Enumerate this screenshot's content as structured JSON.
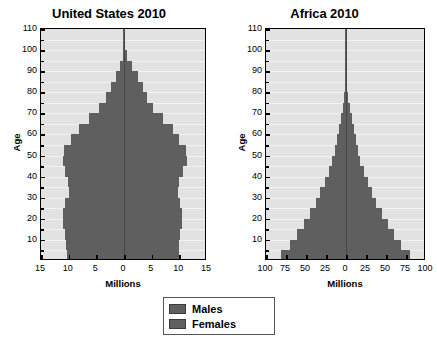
{
  "figure": {
    "background": "#ffffff",
    "bar_color": "#5f5f5f",
    "plot_background": "#e2e2e2",
    "axis_color": "#000000"
  },
  "legend": {
    "position": "bottom-center",
    "items": [
      {
        "label": "Males",
        "color": "#5f5f5f"
      },
      {
        "label": "Females",
        "color": "#5f5f5f"
      }
    ]
  },
  "chart_data": [
    {
      "type": "bar",
      "orientation": "population-pyramid",
      "title": "United States 2010",
      "xlabel": "Millions",
      "ylabel": "Age",
      "xlim": [
        -15,
        15
      ],
      "ylim": [
        0,
        110
      ],
      "grid": true,
      "xticks": [
        -15,
        -10,
        -5,
        0,
        5,
        10,
        15
      ],
      "xticklabels": [
        "15",
        "10",
        "5",
        "0",
        "5",
        "10",
        "15"
      ],
      "yticks": [
        10,
        20,
        30,
        40,
        50,
        60,
        70,
        80,
        90,
        100,
        110
      ],
      "yticklabels": [
        "10",
        "20",
        "30",
        "40",
        "50",
        "60",
        "70",
        "80",
        "90",
        "100",
        "110"
      ],
      "age_bands": [
        0,
        5,
        10,
        15,
        20,
        25,
        30,
        35,
        40,
        45,
        50,
        55,
        60,
        65,
        70,
        75,
        80,
        85,
        90,
        95,
        100,
        105
      ],
      "band_width": 5,
      "series": [
        {
          "name": "Males",
          "side": "left",
          "values": [
            10.3,
            10.4,
            10.6,
            11.0,
            11.0,
            10.6,
            9.9,
            10.1,
            10.6,
            11.1,
            10.8,
            9.5,
            8.2,
            6.3,
            4.5,
            3.3,
            2.4,
            1.5,
            0.7,
            0.25,
            0.05,
            0.01
          ]
        },
        {
          "name": "Females",
          "side": "right",
          "values": [
            9.9,
            10.0,
            10.2,
            10.5,
            10.5,
            10.2,
            9.7,
            10.0,
            10.6,
            11.3,
            11.2,
            10.0,
            8.8,
            7.0,
            5.2,
            4.1,
            3.4,
            2.5,
            1.4,
            0.6,
            0.15,
            0.02
          ]
        }
      ]
    },
    {
      "type": "bar",
      "orientation": "population-pyramid",
      "title": "Africa 2010",
      "xlabel": "Millions",
      "ylabel": "Age",
      "xlim": [
        -100,
        100
      ],
      "ylim": [
        0,
        110
      ],
      "grid": true,
      "xticks": [
        -100,
        -75,
        -50,
        -25,
        0,
        25,
        50,
        75,
        100
      ],
      "xticklabels": [
        "100",
        "75",
        "50",
        "25",
        "0",
        "25",
        "50",
        "75",
        "100"
      ],
      "yticks": [
        10,
        20,
        30,
        40,
        50,
        60,
        70,
        80,
        90,
        100,
        110
      ],
      "yticklabels": [
        "10",
        "20",
        "30",
        "40",
        "50",
        "60",
        "70",
        "80",
        "90",
        "100",
        "110"
      ],
      "age_bands": [
        0,
        5,
        10,
        15,
        20,
        25,
        30,
        35,
        40,
        45,
        50,
        55,
        60,
        65,
        70,
        75,
        80,
        85,
        90,
        95,
        100,
        105
      ],
      "band_width": 5,
      "series": [
        {
          "name": "Males",
          "side": "left",
          "values": [
            81,
            70,
            61,
            53,
            45,
            38,
            32,
            26,
            21,
            17,
            14,
            11,
            8.5,
            6.2,
            4.2,
            2.6,
            1.4,
            0.6,
            0.2,
            0.06,
            0.02,
            0.005
          ]
        },
        {
          "name": "Females",
          "side": "right",
          "values": [
            80,
            69,
            60,
            52,
            45,
            38,
            32,
            27,
            22,
            18,
            15,
            12,
            9.5,
            7.0,
            4.9,
            3.1,
            1.8,
            0.8,
            0.3,
            0.09,
            0.03,
            0.008
          ]
        }
      ]
    }
  ]
}
